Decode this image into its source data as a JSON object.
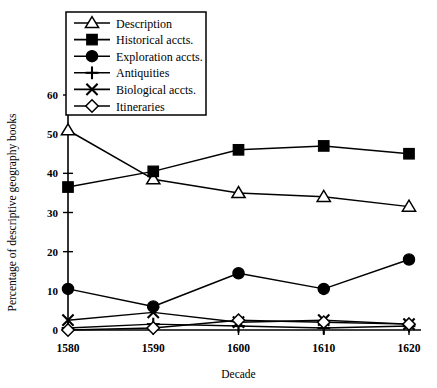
{
  "chart_data": {
    "type": "line",
    "title": "",
    "xlabel": "Decade",
    "ylabel": "Percentage of descriptive geography books",
    "categories": [
      "1580",
      "1590",
      "1600",
      "1610",
      "1620"
    ],
    "x": [
      1580,
      1590,
      1600,
      1610,
      1620
    ],
    "xlim": [
      1580,
      1620
    ],
    "ylim": [
      0,
      60
    ],
    "yticks": [
      0,
      10,
      20,
      30,
      40,
      50,
      60
    ],
    "ytick_labels": [
      "0",
      "10",
      "20",
      "30",
      "40",
      "50",
      "60"
    ],
    "xtick_labels": [
      "1580",
      "1590",
      "1600",
      "1610",
      "1620"
    ],
    "grid": false,
    "legend_position": "top-left",
    "series": [
      {
        "name": "Description",
        "marker": "triangle-open",
        "values": [
          51,
          38.5,
          35,
          34,
          31.5
        ]
      },
      {
        "name": "Historical accts.",
        "marker": "square-filled",
        "values": [
          36.5,
          40.5,
          46,
          47,
          45
        ]
      },
      {
        "name": "Exploration accts.",
        "marker": "circle-filled",
        "values": [
          10.5,
          6,
          14.5,
          10.5,
          18
        ]
      },
      {
        "name": "Antiquities",
        "marker": "plus",
        "values": [
          0.5,
          1.5,
          1,
          0.5,
          1
        ]
      },
      {
        "name": "Biological accts.",
        "marker": "cross",
        "values": [
          2.5,
          4.5,
          2,
          2.5,
          1.5
        ]
      },
      {
        "name": "Itineraries",
        "marker": "diamond-open",
        "values": [
          0,
          0.5,
          2.5,
          2,
          1.5
        ]
      }
    ]
  },
  "legend": {
    "items": [
      {
        "label": "Description",
        "marker": "triangle-open"
      },
      {
        "label": "Historical accts.",
        "marker": "square-filled"
      },
      {
        "label": "Exploration accts.",
        "marker": "circle-filled"
      },
      {
        "label": "Antiquities",
        "marker": "plus"
      },
      {
        "label": "Biological accts.",
        "marker": "cross"
      },
      {
        "label": "Itineraries",
        "marker": "diamond-open"
      }
    ]
  },
  "colors": {
    "ink": "#000000",
    "background": "#ffffff"
  }
}
